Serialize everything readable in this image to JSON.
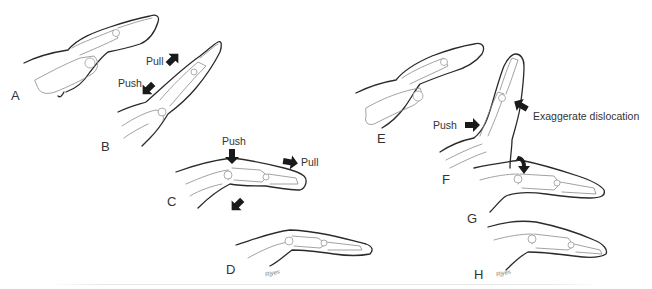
{
  "figure": {
    "panels": [
      {
        "id": "A",
        "label": "A"
      },
      {
        "id": "B",
        "label": "B"
      },
      {
        "id": "C",
        "label": "C"
      },
      {
        "id": "D",
        "label": "D"
      },
      {
        "id": "E",
        "label": "E"
      },
      {
        "id": "F",
        "label": "F"
      },
      {
        "id": "G",
        "label": "G"
      },
      {
        "id": "H",
        "label": "H"
      }
    ],
    "annotations": {
      "b_pull": "Pull",
      "b_push": "Push",
      "c_push": "Push",
      "c_pull": "Pull",
      "f_push": "Push",
      "f_exaggerate": "Exaggerate dislocation"
    },
    "signatures": {
      "d": "Rjyes",
      "h": "Rjyes"
    },
    "colors": {
      "line": "#2a2a2a",
      "arrow": "#1a1a1a",
      "bone": "#9a9a9a",
      "background": "#ffffff"
    }
  }
}
